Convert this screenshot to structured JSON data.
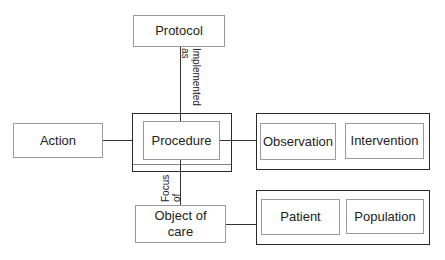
{
  "diagram": {
    "nodes": {
      "protocol": "Protocol",
      "action": "Action",
      "procedure": "Procedure",
      "observation": "Observation",
      "intervention": "Intervention",
      "object_of_care_line1": "Object of",
      "object_of_care_line2": "care",
      "patient": "Patient",
      "population": "Population"
    },
    "edge_labels": {
      "implemented_as_1": "Implemented",
      "implemented_as_2": "as",
      "focus_of_1": "Focus",
      "focus_of_2": "of"
    },
    "colors": {
      "thin_border": "#9a9a9a",
      "thick_border": "#2a2a2a",
      "line": "#333333"
    }
  }
}
